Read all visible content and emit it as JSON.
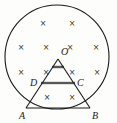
{
  "figure": {
    "type": "geometry-diagram",
    "background_color": "#fdfdfc",
    "stroke_color": "#1a1a1a",
    "cross_color": "#333333",
    "highlight_color": "#8a8a8a",
    "circle": {
      "center_x": 57,
      "center_y": 57,
      "radius": 52
    },
    "points": [
      {
        "id": "O",
        "label": "O",
        "x": 58,
        "y": 56,
        "label_x": 61,
        "label_y": 55
      },
      {
        "id": "A",
        "label": "A",
        "x": 26,
        "y": 108,
        "label_x": 19,
        "label_y": 119
      },
      {
        "id": "B",
        "label": "B",
        "x": 90,
        "y": 108,
        "label_x": 92,
        "label_y": 119
      },
      {
        "id": "D",
        "label": "D",
        "x": 41,
        "y": 83,
        "label_x": 30,
        "label_y": 86
      },
      {
        "id": "C",
        "label": "C",
        "x": 75,
        "y": 83,
        "label_x": 77,
        "label_y": 86
      }
    ],
    "segments": [
      {
        "id": "OA",
        "x1": 58,
        "y1": 59,
        "x2": 26,
        "y2": 108
      },
      {
        "id": "OB",
        "x1": 58,
        "y1": 59,
        "x2": 90,
        "y2": 108
      },
      {
        "id": "AB",
        "x1": 26,
        "y1": 108,
        "x2": 90,
        "y2": 108
      }
    ],
    "highlight_segments": [
      {
        "id": "DC",
        "x1": 41,
        "y1": 83,
        "x2": 75,
        "y2": 83
      },
      {
        "id": "small-bar-below-O",
        "x1": 52,
        "y1": 67,
        "x2": 64,
        "y2": 67
      }
    ],
    "field_symbol": "×",
    "field_marks": [
      {
        "x": 43,
        "y": 23
      },
      {
        "x": 72,
        "y": 23
      },
      {
        "x": 21,
        "y": 47
      },
      {
        "x": 46,
        "y": 47
      },
      {
        "x": 70,
        "y": 47
      },
      {
        "x": 96,
        "y": 47
      },
      {
        "x": 21,
        "y": 72
      },
      {
        "x": 46,
        "y": 72
      },
      {
        "x": 72,
        "y": 72
      },
      {
        "x": 97,
        "y": 72
      },
      {
        "x": 47,
        "y": 97
      },
      {
        "x": 72,
        "y": 97
      }
    ]
  }
}
